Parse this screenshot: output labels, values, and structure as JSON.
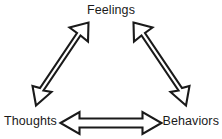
{
  "diagram": {
    "type": "cbt-triangle",
    "background_color": "#ffffff",
    "stroke_color": "#1a1a1a",
    "fill_color": "#ffffff",
    "nodes": [
      {
        "id": "feelings",
        "label": "Feelings",
        "position": "top"
      },
      {
        "id": "thoughts",
        "label": "Thoughts",
        "position": "bottom-left"
      },
      {
        "id": "behaviors",
        "label": "Behaviors",
        "position": "bottom-right"
      }
    ],
    "connectors": [
      {
        "id": "thoughts-feelings",
        "from": "Thoughts",
        "to": "Feelings",
        "style": "hollow-double-headed-arrow",
        "orientation": "diagonal-up-right"
      },
      {
        "id": "feelings-behaviors",
        "from": "Feelings",
        "to": "Behaviors",
        "style": "hollow-double-headed-arrow",
        "orientation": "diagonal-down-right"
      },
      {
        "id": "thoughts-behaviors",
        "from": "Thoughts",
        "to": "Behaviors",
        "style": "hollow-double-headed-arrow",
        "orientation": "horizontal"
      }
    ]
  }
}
